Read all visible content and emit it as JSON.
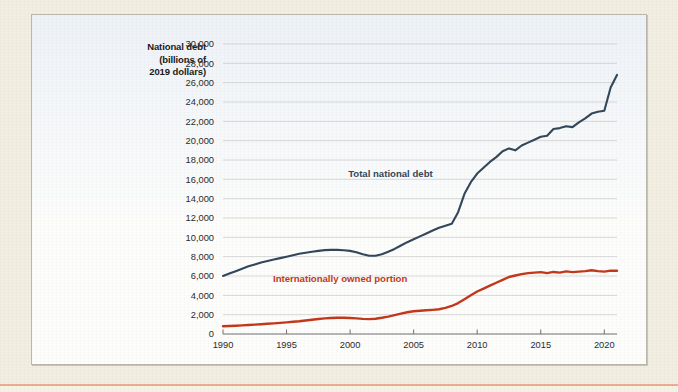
{
  "page": {
    "background_color": "#f2eee1",
    "card_background": "#fdfdfc",
    "accent_rule_color": "#efa083"
  },
  "chart_data": {
    "type": "line",
    "title": "",
    "xlabel": "",
    "ylabel": "National debt (billions of 2019 dollars)",
    "ylabel_lines": [
      "National debt",
      "(billions of",
      "2019 dollars)"
    ],
    "xlim": [
      1990,
      2021
    ],
    "ylim": [
      0,
      30000
    ],
    "grid": true,
    "legend_position": "inline-annotation",
    "ytick_labels": [
      "0",
      "2,000",
      "4,000",
      "6,000",
      "8,000",
      "10,000",
      "12,000",
      "14,000",
      "16,000",
      "18,000",
      "20,000",
      "22,000",
      "24,000",
      "26,000",
      "28,000",
      "30,000"
    ],
    "ytick_values": [
      0,
      2000,
      4000,
      6000,
      8000,
      10000,
      12000,
      14000,
      16000,
      18000,
      20000,
      22000,
      24000,
      26000,
      28000,
      30000
    ],
    "xtick_labels": [
      "1990",
      "1995",
      "2000",
      "2005",
      "2010",
      "2015",
      "2020"
    ],
    "xtick_values": [
      1990,
      1995,
      2000,
      2005,
      2010,
      2015,
      2020
    ],
    "x": [
      1990,
      1990.5,
      1991,
      1991.5,
      1992,
      1992.5,
      1993,
      1993.5,
      1994,
      1994.5,
      1995,
      1995.5,
      1996,
      1996.5,
      1997,
      1997.5,
      1998,
      1998.5,
      1999,
      1999.5,
      2000,
      2000.5,
      2001,
      2001.5,
      2002,
      2002.5,
      2003,
      2003.5,
      2004,
      2004.5,
      2005,
      2005.5,
      2006,
      2006.5,
      2007,
      2007.5,
      2008,
      2008.5,
      2009,
      2009.5,
      2010,
      2010.5,
      2011,
      2011.5,
      2012,
      2012.5,
      2013,
      2013.5,
      2014,
      2014.5,
      2015,
      2015.5,
      2016,
      2016.5,
      2017,
      2017.5,
      2018,
      2018.5,
      2019,
      2019.5,
      2020,
      2020.5,
      2021
    ],
    "series": [
      {
        "name": "Total national debt",
        "color": "#33475b",
        "label_color": "#33475b",
        "values": [
          6000,
          6250,
          6500,
          6750,
          7000,
          7200,
          7400,
          7550,
          7700,
          7850,
          8000,
          8150,
          8300,
          8400,
          8500,
          8600,
          8680,
          8700,
          8700,
          8660,
          8600,
          8450,
          8250,
          8100,
          8100,
          8250,
          8500,
          8800,
          9150,
          9500,
          9800,
          10100,
          10400,
          10700,
          11000,
          11200,
          11400,
          12600,
          14500,
          15700,
          16600,
          17200,
          17800,
          18300,
          18900,
          19200,
          19000,
          19500,
          19800,
          20100,
          20400,
          20500,
          21200,
          21300,
          21500,
          21400,
          21900,
          22300,
          22800,
          23000,
          23100,
          25500,
          26800
        ]
      },
      {
        "name": "Internationally owned portion",
        "color": "#c4381a",
        "label_color": "#c4381a",
        "values": [
          800,
          830,
          860,
          890,
          930,
          970,
          1010,
          1060,
          1100,
          1150,
          1200,
          1260,
          1320,
          1400,
          1480,
          1550,
          1620,
          1660,
          1680,
          1680,
          1660,
          1620,
          1560,
          1540,
          1580,
          1680,
          1800,
          1950,
          2100,
          2250,
          2350,
          2400,
          2450,
          2500,
          2560,
          2700,
          2900,
          3200,
          3600,
          4000,
          4400,
          4700,
          5000,
          5300,
          5600,
          5900,
          6050,
          6200,
          6300,
          6350,
          6400,
          6300,
          6420,
          6350,
          6480,
          6400,
          6450,
          6500,
          6600,
          6500,
          6450,
          6550,
          6550
        ]
      }
    ],
    "annotations": [
      {
        "text": "Total national debt",
        "series": "Total national debt",
        "x": 2006.5,
        "y": 16200
      },
      {
        "text": "Internationally owned portion",
        "series": "Internationally owned portion",
        "x": 2004.5,
        "y": 5400
      }
    ]
  }
}
